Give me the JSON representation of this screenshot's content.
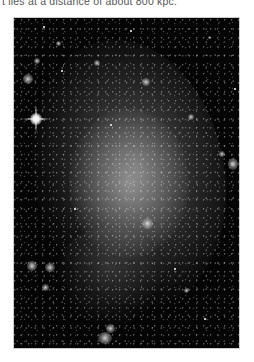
{
  "caption": {
    "text": "t lies at a distance of about 800 kpc."
  },
  "figure": {
    "alt": "Grayscale astronomical photograph of a face-on spiral galaxy with a diffuse bright central region, scattered star clusters, and a bright foreground star with diffraction spikes at the upper left",
    "type": "astronomical-image",
    "colors": {
      "background": "#050505",
      "galaxy_glow": "#b4b4b4",
      "stars": "#ffffff"
    }
  }
}
